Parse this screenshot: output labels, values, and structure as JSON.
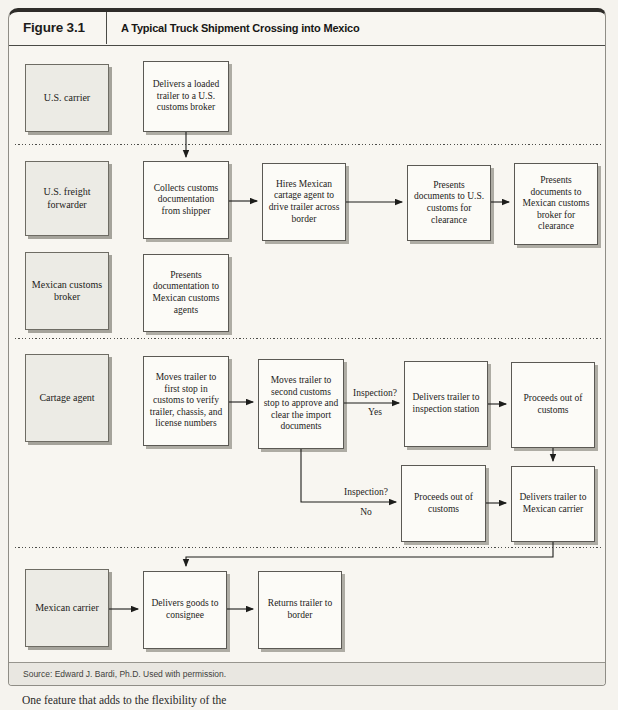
{
  "header": {
    "figure_number": "Figure 3.1",
    "title": "A Typical Truck Shipment Crossing into Mexico"
  },
  "row_labels": {
    "us_carrier": "U.S. carrier",
    "us_freight_forwarder": "U.S. freight forwarder",
    "mexican_customs_broker": "Mexican customs broker",
    "cartage_agent": "Cartage agent",
    "mexican_carrier": "Mexican carrier"
  },
  "nodes": {
    "delivers_loaded_trailer": "Delivers a loaded trailer to a U.S. customs broker",
    "collects_customs_documentation": "Collects customs documentation from shipper",
    "hires_mexican_cartage_agent": "Hires Mexican cartage agent to drive trailer across border",
    "presents_documents_us_customs": "Presents documents to U.S. customs for clearance",
    "presents_documents_mexican_broker": "Presents documents to Mexican customs broker for clearance",
    "presents_documentation_mexican_agents": "Presents documentation to Mexican customs agents",
    "moves_trailer_first_stop": "Moves trailer to first stop in customs to verify trailer, chassis, and license numbers",
    "moves_trailer_second_stop": "Moves trailer to second customs stop to approve and clear the import documents",
    "delivers_trailer_inspection_station": "Delivers trailer to inspection station",
    "proceeds_out_of_customs_yes": "Proceeds out of customs",
    "proceeds_out_of_customs_no": "Proceeds out of customs",
    "delivers_trailer_mexican_carrier": "Delivers trailer to Mexican carrier",
    "delivers_goods_consignee": "Delivers goods to consignee",
    "returns_trailer_border": "Returns trailer to border"
  },
  "decisions": {
    "inspection_yes": {
      "question": "Inspection?",
      "answer": "Yes"
    },
    "inspection_no": {
      "question": "Inspection?",
      "answer": "No"
    }
  },
  "source": "Source: Edward J. Bardi, Ph.D. Used with permission.",
  "body_text": "One feature that adds to the flexibility of the",
  "colors": {
    "page_bg": "#f5f3ee",
    "panel_top_border": "#2e2c29",
    "label_box_fill": "#ecebe5",
    "process_box_fill": "#fcfbf7",
    "box_border": "#5b5954",
    "box_shadow": "#aeaca4",
    "line_color": "#1d1d1b",
    "source_bar_fill": "#e9e7e1"
  }
}
